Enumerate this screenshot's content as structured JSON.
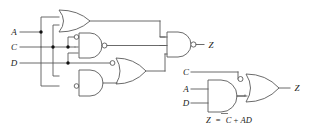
{
  "figure": {
    "kind": "logic-circuit-diagram",
    "stroke_color": "#5a5a5a",
    "text_color": "#222222",
    "background_color": "#ffffff"
  },
  "left_circuit": {
    "name": "original-circuit",
    "inputs": [
      {
        "id": "A",
        "label": "A",
        "x": 14,
        "y": 32
      },
      {
        "id": "C",
        "label": "C",
        "x": 14,
        "y": 47
      },
      {
        "id": "D",
        "label": "D",
        "x": 14,
        "y": 63
      }
    ],
    "output": {
      "id": "Z",
      "label": "Z",
      "x": 213,
      "y": 42
    },
    "gates": [
      {
        "id": "g1",
        "type": "OR",
        "inverted_inputs": [],
        "inverted_output": false
      },
      {
        "id": "g2",
        "type": "AND",
        "inverted_inputs": [
          "top"
        ],
        "inverted_output": true
      },
      {
        "id": "g3",
        "type": "AND",
        "inverted_inputs": [
          "bottom"
        ],
        "inverted_output": false
      },
      {
        "id": "g4",
        "type": "OR",
        "inverted_inputs": [
          "top"
        ],
        "inverted_output": false
      },
      {
        "id": "g5",
        "type": "AND",
        "inverted_inputs": [],
        "inverted_output": true
      }
    ]
  },
  "right_circuit": {
    "name": "simplified-circuit",
    "inputs": [
      {
        "id": "C",
        "label": "C",
        "x": 185,
        "y": 72
      },
      {
        "id": "A",
        "label": "A",
        "x": 185,
        "y": 89
      },
      {
        "id": "D",
        "label": "D",
        "x": 185,
        "y": 103
      }
    ],
    "output": {
      "id": "Z",
      "label": "Z",
      "x": 297,
      "y": 88
    },
    "gates": [
      {
        "id": "s1",
        "type": "AND",
        "inverted_inputs": [],
        "inverted_output": false
      },
      {
        "id": "s2",
        "type": "OR",
        "inverted_inputs": [
          "top"
        ],
        "inverted_output": false
      }
    ]
  },
  "equation": {
    "name": "boolean-equation",
    "lhs": "Z",
    "equals": "=",
    "term_overbar": "C",
    "plus": "+",
    "term_product": "AD",
    "full_text": "Z = C̄+AD"
  }
}
